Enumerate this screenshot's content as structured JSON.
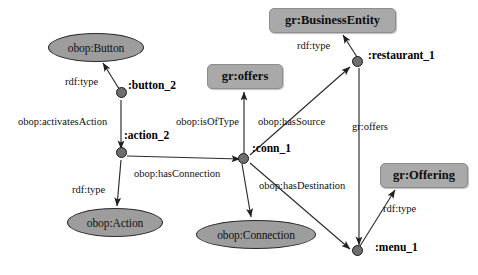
{
  "diagram": {
    "background_color": "#ffffff",
    "class_node_fill": "#9d9d9d",
    "rect_node_fill": "#a9a9a9",
    "instance_node_fill": "#6e6e6e",
    "edge_color": "#2b2b2b"
  },
  "class_nodes": [
    {
      "id": "obop_button",
      "label": "obop:Button",
      "shape": "ellipse",
      "x": 48,
      "y": 33,
      "w": 96,
      "h": 29
    },
    {
      "id": "obop_action",
      "label": "obop:Action",
      "shape": "ellipse",
      "x": 67,
      "y": 208,
      "w": 96,
      "h": 29
    },
    {
      "id": "obop_connection",
      "label": "obop:Connection",
      "shape": "ellipse",
      "x": 196,
      "y": 220,
      "w": 120,
      "h": 29
    }
  ],
  "rect_nodes": [
    {
      "id": "gr_business_entity",
      "label": "gr:BusinessEntity",
      "shape": "rounded-rect",
      "x": 269,
      "y": 8,
      "w": 127,
      "h": 25
    },
    {
      "id": "gr_offers_class",
      "label": "gr:offers",
      "shape": "rounded-rect",
      "x": 207,
      "y": 64,
      "w": 76,
      "h": 25
    },
    {
      "id": "gr_offering",
      "label": "gr:Offering",
      "shape": "rounded-rect",
      "x": 380,
      "y": 163,
      "w": 88,
      "h": 25
    }
  ],
  "instance_nodes": [
    {
      "id": "button_2",
      "label": ":button_2",
      "x": 118,
      "y": 92,
      "label_x": 128,
      "label_y": 86
    },
    {
      "id": "action_2",
      "label": ":action_2",
      "x": 118,
      "y": 152,
      "label_x": 124,
      "label_y": 134
    },
    {
      "id": "conn_1",
      "label": ":conn_1",
      "x": 243,
      "y": 158,
      "label_x": 252,
      "label_y": 147
    },
    {
      "id": "restaurant_1",
      "label": ":restaurant_1",
      "x": 357,
      "y": 61,
      "label_x": 368,
      "label_y": 54
    },
    {
      "id": "menu_1",
      "label": ":menu_1",
      "x": 357,
      "y": 250,
      "label_x": 375,
      "label_y": 246
    }
  ],
  "edges": [
    {
      "id": "e1",
      "predicate": "rdf:type",
      "from": "button_2",
      "to": "obop_button",
      "x1": 121,
      "y1": 92,
      "x2": 103,
      "y2": 63,
      "label_x": 65,
      "label_y": 76
    },
    {
      "id": "e2",
      "predicate": "obop:activatesAction",
      "from": "button_2",
      "to": "action_2",
      "x1": 121,
      "y1": 100,
      "x2": 121,
      "y2": 149,
      "label_x": 18,
      "label_y": 116
    },
    {
      "id": "e3",
      "predicate": "rdf:type",
      "from": "action_2",
      "to": "obop_action",
      "x1": 121,
      "y1": 160,
      "x2": 117,
      "y2": 206,
      "label_x": 72,
      "label_y": 184
    },
    {
      "id": "e4",
      "predicate": "obop:hasConnection",
      "from": "action_2",
      "to": "conn_1",
      "x1": 127,
      "y1": 156,
      "x2": 240,
      "y2": 159,
      "label_x": 134,
      "label_y": 168
    },
    {
      "id": "e5",
      "predicate": "obop:isOfType",
      "from": "conn_1",
      "to": "gr_offers_class",
      "x1": 244,
      "y1": 155,
      "x2": 244,
      "y2": 92,
      "label_x": 176,
      "label_y": 116
    },
    {
      "id": "e6",
      "predicate": "obop:hasSource",
      "from": "conn_1",
      "to": "restaurant_1",
      "x1": 250,
      "y1": 155,
      "x2": 350,
      "y2": 67,
      "label_x": 258,
      "label_y": 116
    },
    {
      "id": "e7",
      "predicate": "obop:hasDestination",
      "from": "conn_1",
      "to": "menu_1",
      "x1": 250,
      "y1": 163,
      "x2": 350,
      "y2": 249,
      "label_x": 259,
      "label_y": 180
    },
    {
      "id": "e8",
      "predicate": "rdf:type",
      "from": "conn_1",
      "to": "obop_connection",
      "x1": 242,
      "y1": 164,
      "x2": 251,
      "y2": 217,
      "label_x": 0,
      "label_y": 0,
      "hide_label": true
    },
    {
      "id": "e9",
      "predicate": "rdf:type",
      "from": "restaurant_1",
      "to": "gr_business_entity",
      "x1": 357,
      "y1": 57,
      "x2": 343,
      "y2": 35,
      "label_x": 297,
      "label_y": 40
    },
    {
      "id": "e10",
      "predicate": "gr:offers",
      "from": "restaurant_1",
      "to": "menu_1",
      "x1": 359,
      "y1": 68,
      "x2": 359,
      "y2": 245,
      "label_x": 352,
      "label_y": 121
    },
    {
      "id": "e11",
      "predicate": "rdf:type",
      "from": "menu_1",
      "to": "gr_offering",
      "x1": 360,
      "y1": 246,
      "x2": 395,
      "y2": 190,
      "label_x": 383,
      "label_y": 203
    }
  ]
}
